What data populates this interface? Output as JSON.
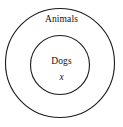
{
  "diagram": {
    "type": "euler-diagram",
    "width": 123,
    "height": 127,
    "background_color": "#ffffff",
    "stroke_color": "#1a1a1a",
    "stroke_width": 1,
    "text_color": "#111111",
    "outer_set": {
      "label": "Animals",
      "cx": 60,
      "cy": 63,
      "r": 55
    },
    "inner_set": {
      "label": "Dogs",
      "cx": 60,
      "cy": 65,
      "r": 30
    },
    "element": {
      "label": "x",
      "style": "italic"
    }
  }
}
